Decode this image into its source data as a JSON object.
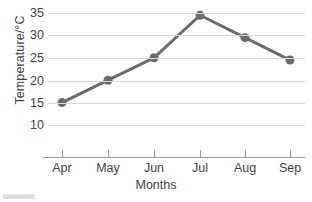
{
  "chart_data": {
    "type": "line",
    "title": "",
    "subtitle": "",
    "xlabel": "Months",
    "ylabel": "Temperature/°C",
    "categories": [
      "Apr",
      "May",
      "Jun",
      "Jul",
      "Aug",
      "Sep"
    ],
    "values": [
      15,
      20,
      25,
      34.5,
      29.5,
      24.5
    ],
    "series": [
      {
        "name": "Temperature",
        "values": [
          15,
          20,
          25,
          34.5,
          29.5,
          24.5
        ]
      }
    ],
    "ylim": [
      8,
      36.5
    ],
    "xlim": [
      0,
      7
    ],
    "y_ticks": [
      10,
      15,
      20,
      25,
      30,
      35
    ],
    "y_tick_labels": [
      "10",
      "15",
      "20",
      "25",
      "30",
      "35"
    ],
    "x_tick_labels": [
      "Apr",
      "May",
      "Jun",
      "Jul",
      "Aug",
      "Sep"
    ],
    "grid": true,
    "grid_axis": "y",
    "legend": false,
    "legend_position": "none",
    "annotations": [],
    "colors": {
      "line": "#6b6b6b",
      "marker": "#6b6b6b",
      "gridline": "#d8d8d8",
      "axis": "#9a9a9a",
      "text": "#3f3f3f",
      "background": "#ffffff"
    },
    "line_width": 3,
    "marker_shape": "circle",
    "marker_radius": 4.5
  },
  "artifact": {
    "bottom_left_fragment": "▄▄▄▄"
  }
}
